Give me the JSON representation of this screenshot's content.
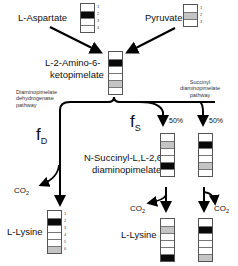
{
  "substrates": {
    "aspartate": {
      "label": "L-Aspartate",
      "cells": [
        "white",
        "black",
        "white",
        "white"
      ],
      "numbers": [
        "1",
        "2",
        "3",
        "4"
      ]
    },
    "pyruvate": {
      "label": "Pyruvate",
      "cells": [
        "white",
        "gray",
        "white"
      ],
      "numbers": [
        "1",
        "2",
        "3"
      ]
    }
  },
  "intermediate": {
    "label_line1": "L-2-Amino-6-",
    "label_line2": "ketopimelate",
    "cells": [
      "white",
      "black",
      "white",
      "white",
      "gray",
      "white"
    ]
  },
  "pathways": {
    "dehydrogenase": {
      "label": "Diaminopimelate dehydrogenase pathway",
      "flux_symbol": "f",
      "flux_sub": "D"
    },
    "succinyl": {
      "label": "Succinyl diaminopimelate pathway",
      "flux_symbol": "f",
      "flux_sub": "S",
      "split_left": "50%",
      "split_right": "50%"
    }
  },
  "succinyl_intermediate": {
    "label_line1": "N-Succinyl-L,L-2,6-",
    "label_line2": "diaminopimelate",
    "left_cells": [
      "white",
      "gray",
      "white",
      "white",
      "black",
      "white"
    ],
    "right_cells": [
      "white",
      "black",
      "white",
      "white",
      "gray",
      "white"
    ]
  },
  "products": {
    "co2": {
      "text": "CO",
      "sub": "2"
    },
    "lysine_label": "L-Lysine",
    "dehydrogenase_lysine": {
      "cells": [
        "white",
        "black",
        "white",
        "white",
        "white",
        "gray"
      ],
      "numbers": [
        "1",
        "2",
        "3",
        "4",
        "5",
        "6"
      ]
    },
    "succinyl_left_lysine": {
      "cells": [
        "white",
        "gray",
        "white",
        "white",
        "white",
        "black"
      ]
    },
    "succinyl_right_lysine": {
      "cells": [
        "white",
        "black",
        "white",
        "white",
        "white",
        "gray"
      ]
    }
  },
  "colors": {
    "black": "#0a0a0a",
    "gray": "#c4c4c4",
    "white": "#ffffff",
    "line": "#000000"
  }
}
